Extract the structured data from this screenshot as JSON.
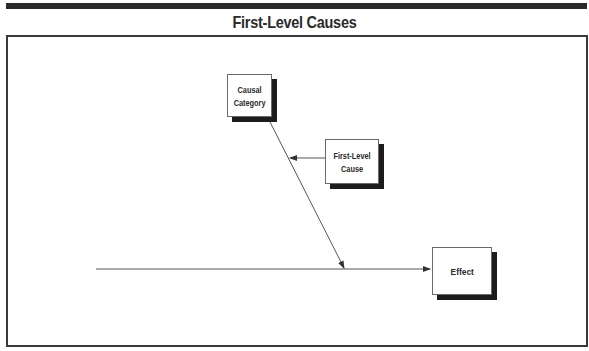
{
  "title": "First-Level Causes",
  "diagram": {
    "type": "fishbone-detail",
    "nodes": {
      "causal_category": {
        "line1": "Causal",
        "line2": "Category"
      },
      "first_level_cause": {
        "line1": "First-Level",
        "line2": "Cause"
      },
      "effect": {
        "label": "Effect"
      }
    },
    "edges": [
      {
        "from": "causal_category",
        "to": "spine",
        "label": ""
      },
      {
        "from": "first_level_cause",
        "to": "causal_category_bone",
        "label": ""
      },
      {
        "from": "spine_start",
        "to": "effect",
        "label": ""
      }
    ]
  },
  "colors": {
    "ink": "#2a2a2a",
    "line": "#555555",
    "shadow": "#1c1c1c"
  }
}
